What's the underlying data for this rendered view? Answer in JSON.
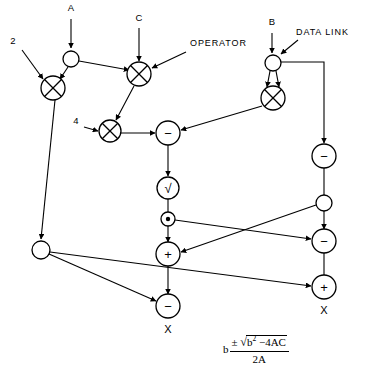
{
  "figure": {
    "background_color": "#ffffff",
    "line_color": "#000000"
  },
  "annotations": [
    {
      "id": "operator-annotation",
      "text": "OPERATOR",
      "x": 190,
      "y": 46
    },
    {
      "id": "data-link-annotation",
      "text": "DATA LINK",
      "x": 296,
      "y": 35
    }
  ],
  "inputs": [
    {
      "id": "input-a",
      "label": "A",
      "x": 71,
      "y": 11
    },
    {
      "id": "input-c",
      "label": "C",
      "x": 139,
      "y": 21
    },
    {
      "id": "input-b",
      "label": "B",
      "x": 272,
      "y": 25
    },
    {
      "id": "input-2",
      "label": "2",
      "x": 13,
      "y": 44
    },
    {
      "id": "input-4",
      "label": "4",
      "x": 76,
      "y": 124
    }
  ],
  "outputs": [
    {
      "id": "output-x-center",
      "label": "X",
      "x": 168,
      "y": 333
    },
    {
      "id": "output-x-right",
      "label": "X",
      "x": 324,
      "y": 314
    }
  ],
  "nodes": [
    {
      "id": "link-a",
      "name": "data-link-a",
      "type": "link",
      "glyph": "",
      "x": 71,
      "y": 59,
      "r": 8
    },
    {
      "id": "mul-2a",
      "name": "operator-multiply-2a",
      "type": "cross",
      "glyph": "x",
      "x": 53,
      "y": 88,
      "r": 12
    },
    {
      "id": "mul-ac",
      "name": "operator-multiply-ac",
      "type": "cross",
      "glyph": "x",
      "x": 139,
      "y": 74,
      "r": 12
    },
    {
      "id": "mul-4ac",
      "name": "operator-multiply-4ac",
      "type": "cross",
      "glyph": "x",
      "x": 110,
      "y": 131,
      "r": 11
    },
    {
      "id": "link-b",
      "name": "data-link-b",
      "type": "link",
      "glyph": "",
      "x": 273,
      "y": 63,
      "r": 8
    },
    {
      "id": "mul-bb",
      "name": "operator-multiply-bb",
      "type": "cross",
      "glyph": "x",
      "x": 273,
      "y": 98,
      "r": 12
    },
    {
      "id": "sub-disc",
      "name": "operator-subtract-discriminant",
      "type": "op",
      "glyph": "−",
      "x": 168,
      "y": 133,
      "r": 12
    },
    {
      "id": "sqrt-disc",
      "name": "operator-square-root",
      "type": "op",
      "glyph": "√",
      "x": 168,
      "y": 188,
      "r": 11
    },
    {
      "id": "pm-node",
      "name": "operator-plus-minus",
      "type": "dot",
      "glyph": "·",
      "x": 168,
      "y": 219,
      "r": 7
    },
    {
      "id": "neg-b",
      "name": "operator-negate-b",
      "type": "op",
      "glyph": "−",
      "x": 324,
      "y": 156,
      "r": 12
    },
    {
      "id": "link-negb",
      "name": "data-link-negated-b",
      "type": "link",
      "glyph": "",
      "x": 324,
      "y": 203,
      "r": 8
    },
    {
      "id": "link-2a",
      "name": "data-link-2a",
      "type": "link",
      "glyph": "",
      "x": 41,
      "y": 250,
      "r": 9
    },
    {
      "id": "add-center",
      "name": "operator-add-center",
      "type": "op",
      "glyph": "+",
      "x": 168,
      "y": 254,
      "r": 12
    },
    {
      "id": "sub-right",
      "name": "operator-subtract-right",
      "type": "op",
      "glyph": "−",
      "x": 324,
      "y": 241,
      "r": 12
    },
    {
      "id": "sub-center",
      "name": "operator-divide-center",
      "type": "op",
      "glyph": "−",
      "x": 168,
      "y": 306,
      "r": 12
    },
    {
      "id": "add-right",
      "name": "operator-divide-right",
      "type": "op",
      "glyph": "+",
      "x": 324,
      "y": 287,
      "r": 12
    }
  ],
  "formula": {
    "lead": "b",
    "plus_minus": "±",
    "radical": "√",
    "radicand": "b² −4AC",
    "numerator": "b ± √(b² − 4AC)",
    "denominator": "2A",
    "full": "b ± √(b² − 4AC) / 2A"
  }
}
